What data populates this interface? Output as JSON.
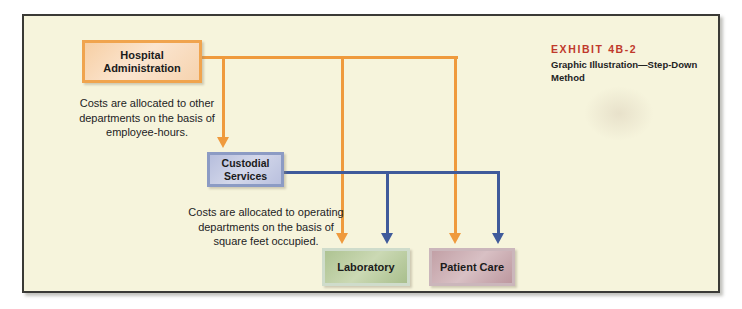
{
  "exhibit": {
    "title": "EXHIBIT 4B-2",
    "subtitle": "Graphic Illustration—Step-Down Method"
  },
  "diagram": {
    "type": "flow",
    "nodes": [
      {
        "id": "admin",
        "label": "Hospital\nAdministration",
        "label_line1": "Hospital",
        "label_line2": "Administration",
        "role": "service-department",
        "color": "#f0a44e"
      },
      {
        "id": "custodial",
        "label": "Custodial\nServices",
        "label_line1": "Custodial",
        "label_line2": "Services",
        "role": "service-department",
        "color": "#8c9bc4"
      },
      {
        "id": "lab",
        "label": "Laboratory",
        "role": "operating-department",
        "color": "#aec392"
      },
      {
        "id": "patient",
        "label": "Patient Care",
        "role": "operating-department",
        "color": "#c2a0a6"
      }
    ],
    "edges": [
      {
        "from": "admin",
        "to": "custodial",
        "color": "#ef9a3d"
      },
      {
        "from": "admin",
        "to": "lab",
        "color": "#ef9a3d"
      },
      {
        "from": "admin",
        "to": "patient",
        "color": "#ef9a3d"
      },
      {
        "from": "custodial",
        "to": "lab",
        "color": "#3f5a9b"
      },
      {
        "from": "custodial",
        "to": "patient",
        "color": "#3f5a9b"
      }
    ],
    "captions": {
      "admin_basis": "Costs are allocated to other departments on the basis of employee-hours.",
      "custodial_basis": "Costs are allocated to operating departments on the basis of square feet occupied."
    }
  }
}
